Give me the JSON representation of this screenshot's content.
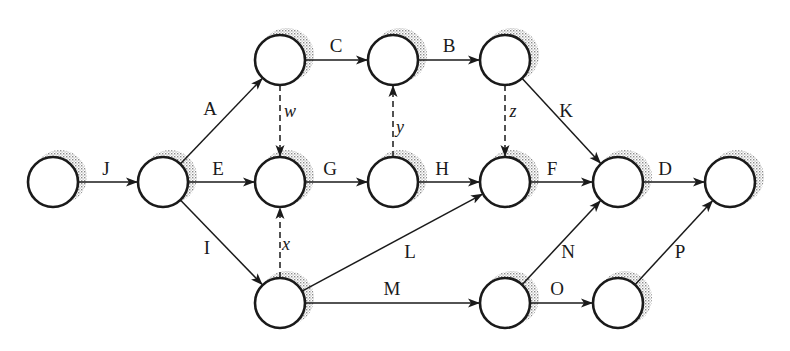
{
  "diagram": {
    "type": "activity-on-arrow network",
    "node_radius": 25,
    "colors": {
      "stroke": "#1a1a1a",
      "shadow": "#9a9a9a",
      "fill": "#ffffff"
    },
    "nodes": [
      {
        "id": "n1",
        "x": 53,
        "y": 182
      },
      {
        "id": "n2",
        "x": 163,
        "y": 182
      },
      {
        "id": "n3",
        "x": 280,
        "y": 60
      },
      {
        "id": "n4",
        "x": 393,
        "y": 60
      },
      {
        "id": "n5",
        "x": 505,
        "y": 60
      },
      {
        "id": "n6",
        "x": 280,
        "y": 182
      },
      {
        "id": "n7",
        "x": 393,
        "y": 182
      },
      {
        "id": "n8",
        "x": 505,
        "y": 182
      },
      {
        "id": "n9",
        "x": 618,
        "y": 182
      },
      {
        "id": "n10",
        "x": 730,
        "y": 182
      },
      {
        "id": "n11",
        "x": 280,
        "y": 303
      },
      {
        "id": "n12",
        "x": 505,
        "y": 303
      },
      {
        "id": "n13",
        "x": 618,
        "y": 303
      }
    ],
    "edges": [
      {
        "label": "J",
        "from": "n1",
        "to": "n2",
        "dashed": false,
        "lx": 106,
        "ly": 175
      },
      {
        "label": "A",
        "from": "n2",
        "to": "n3",
        "dashed": false,
        "lx": 210,
        "ly": 115
      },
      {
        "label": "E",
        "from": "n2",
        "to": "n6",
        "dashed": false,
        "lx": 218,
        "ly": 175
      },
      {
        "label": "I",
        "from": "n2",
        "to": "n11",
        "dashed": false,
        "lx": 207,
        "ly": 254
      },
      {
        "label": "C",
        "from": "n3",
        "to": "n4",
        "dashed": false,
        "lx": 336,
        "ly": 52
      },
      {
        "label": "B",
        "from": "n4",
        "to": "n5",
        "dashed": false,
        "lx": 449,
        "ly": 52
      },
      {
        "label": "w",
        "from": "n3",
        "to": "n6",
        "dashed": true,
        "lx": 290,
        "ly": 117
      },
      {
        "label": "y",
        "from": "n7",
        "to": "n4",
        "dashed": true,
        "lx": 400,
        "ly": 133
      },
      {
        "label": "z",
        "from": "n5",
        "to": "n8",
        "dashed": true,
        "lx": 513,
        "ly": 117
      },
      {
        "label": "K",
        "from": "n5",
        "to": "n9",
        "dashed": false,
        "lx": 566,
        "ly": 117
      },
      {
        "label": "G",
        "from": "n6",
        "to": "n7",
        "dashed": false,
        "lx": 330,
        "ly": 175
      },
      {
        "label": "H",
        "from": "n7",
        "to": "n8",
        "dashed": false,
        "lx": 442,
        "ly": 175
      },
      {
        "label": "F",
        "from": "n8",
        "to": "n9",
        "dashed": false,
        "lx": 552,
        "ly": 175
      },
      {
        "label": "D",
        "from": "n9",
        "to": "n10",
        "dashed": false,
        "lx": 665,
        "ly": 175
      },
      {
        "label": "x",
        "from": "n11",
        "to": "n6",
        "dashed": true,
        "lx": 286,
        "ly": 250
      },
      {
        "label": "L",
        "from": "n11",
        "to": "n8",
        "dashed": false,
        "lx": 410,
        "ly": 258
      },
      {
        "label": "M",
        "from": "n11",
        "to": "n12",
        "dashed": false,
        "lx": 392,
        "ly": 295
      },
      {
        "label": "N",
        "from": "n12",
        "to": "n9",
        "dashed": false,
        "lx": 568,
        "ly": 258
      },
      {
        "label": "O",
        "from": "n12",
        "to": "n13",
        "dashed": false,
        "lx": 557,
        "ly": 295
      },
      {
        "label": "P",
        "from": "n13",
        "to": "n10",
        "dashed": false,
        "lx": 680,
        "ly": 258
      }
    ]
  }
}
